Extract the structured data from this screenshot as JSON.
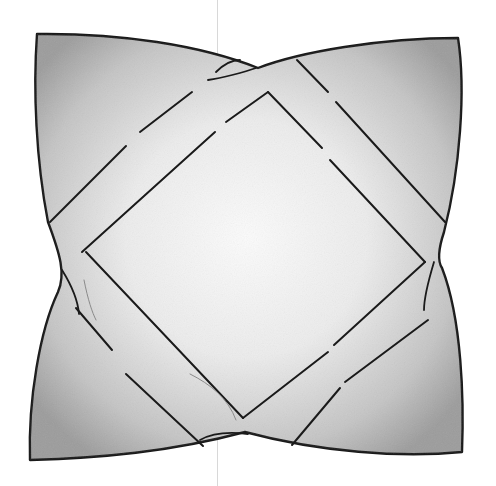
{
  "image": {
    "subject": "sketch of a square cushion with diamond band pattern",
    "colors": {
      "background": "#ffffff",
      "outline": "#1a1a1a",
      "shade_dark": "#9a9a9a",
      "shade_mid": "#c8c8c8",
      "highlight": "#f7f7f7",
      "fold_line": "#d8d8d8"
    }
  }
}
